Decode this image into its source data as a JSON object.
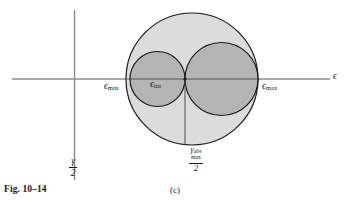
{
  "figure": {
    "caption": "Fig. 10–14",
    "panel_label": "(c)",
    "type": "diagram"
  },
  "axes": {
    "x_axis_label": "ϵ",
    "y_axis_label_numerator": "γ",
    "y_axis_label_denominator": "2",
    "x_axis_name": "epsilon-axis",
    "y_axis_name": "gamma-over-2-axis"
  },
  "labels": {
    "eps_min": {
      "symbol": "ϵ",
      "subscript": "min",
      "name": "epsilon-min"
    },
    "eps_int": {
      "symbol": "ϵ",
      "subscript": "int",
      "name": "epsilon-int"
    },
    "eps_max": {
      "symbol": "ϵ",
      "subscript": "max",
      "name": "epsilon-max"
    },
    "gamma_abs_max_over_2": {
      "symbol": "γ",
      "superscript": "abs",
      "subscript": "max",
      "denominator": "2",
      "name": "gamma-abs-max-over-2"
    }
  },
  "colors": {
    "outer_circle_fill": "#dcdcdc",
    "inner_circle_fill": "#b4b4b4",
    "stroke": "#1a1a1a",
    "axis": "#555555",
    "background": "#ffffff"
  },
  "chart_data": {
    "type": "diagram",
    "title": "Fig. 10–14 (c)",
    "xlabel": "ϵ",
    "ylabel": "γ/2",
    "origin": {
      "x": 185,
      "y": 79
    },
    "circles": [
      {
        "name": "outer-circle",
        "cx": 192,
        "cy": 79,
        "r": 66,
        "fill": "#dcdcdc",
        "stroke": "#1a1a1a"
      },
      {
        "name": "left-inner-circle",
        "cx": 157.5,
        "cy": 79,
        "r": 27.5,
        "fill": "#b4b4b4",
        "stroke": "#1a1a1a"
      },
      {
        "name": "right-inner-circle",
        "cx": 221.5,
        "cy": 79,
        "r": 36.5,
        "fill": "#b4b4b4",
        "stroke": "#1a1a1a"
      }
    ],
    "markers": [
      {
        "name": "origin-dot",
        "x": 185,
        "y": 79
      }
    ],
    "guide_lines": [
      {
        "name": "gamma-abs-max-dropline",
        "x1": 185,
        "y1": 79,
        "x2": 185,
        "y2": 145
      }
    ],
    "axis_extents": {
      "x_start": 12,
      "x_end": 330,
      "y_value": 79,
      "y_start": 10,
      "y_end": 180,
      "x_value": 74.5
    }
  }
}
